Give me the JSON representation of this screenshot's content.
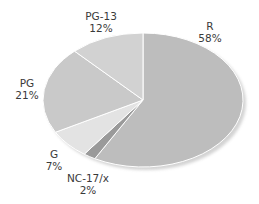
{
  "chart_data": {
    "type": "pie",
    "title": "",
    "categories": [
      "R",
      "NC-17/x",
      "G",
      "PG",
      "PG-13"
    ],
    "values": [
      58,
      2,
      7,
      21,
      12
    ],
    "unit": "%",
    "colors": [
      "#bdbdbd",
      "#9a9a9a",
      "#e3e3e3",
      "#c9c9c9",
      "#d2d2d2"
    ],
    "start_angle_deg": 0,
    "direction": "clockwise-from-top",
    "legend": "none (direct labels)",
    "labels": [
      {
        "name": "R",
        "pct": "58%"
      },
      {
        "name": "NC-17/x",
        "pct": "2%"
      },
      {
        "name": "G",
        "pct": "7%"
      },
      {
        "name": "PG",
        "pct": "21%"
      },
      {
        "name": "PG-13",
        "pct": "12%"
      }
    ]
  }
}
